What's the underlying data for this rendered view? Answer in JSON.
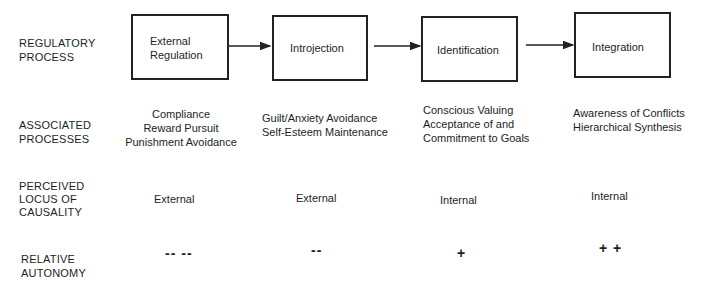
{
  "row_labels": {
    "regulatory": [
      "REGULATORY",
      "PROCESS"
    ],
    "associated": [
      "ASSOCIATED",
      "PROCESSES"
    ],
    "locus": [
      "PERCEIVED",
      "LOCUS OF",
      "CAUSALITY"
    ],
    "autonomy": [
      "RELATIVE",
      "AUTONOMY"
    ]
  },
  "stages": [
    {
      "box_lines": [
        "External",
        "Regulation"
      ],
      "associated": [
        "Compliance",
        "Reward Pursuit",
        "Punishment Avoidance"
      ],
      "locus": "External",
      "autonomy": "-- --"
    },
    {
      "box_lines": [
        "Introjection"
      ],
      "associated": [
        "Guilt/Anxiety Avoidance",
        "Self-Esteem Maintenance"
      ],
      "locus": "External",
      "autonomy": "--"
    },
    {
      "box_lines": [
        "Identification"
      ],
      "associated": [
        "Conscious Valuing",
        "Acceptance of and",
        "Commitment to Goals"
      ],
      "locus": "Internal",
      "autonomy": "+"
    },
    {
      "box_lines": [
        "Integration"
      ],
      "associated": [
        "Awareness of Conflicts",
        "Hierarchical Synthesis"
      ],
      "locus": "Internal",
      "autonomy": "+ +"
    }
  ],
  "colors": {
    "line": "#222222",
    "text": "#1e1e1e",
    "background": "#ffffff"
  }
}
